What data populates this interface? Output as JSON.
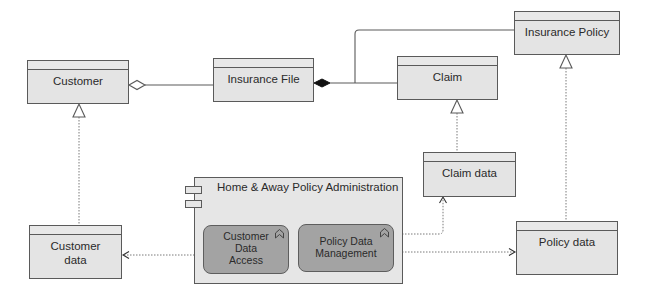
{
  "diagram": {
    "type": "ArchiMate / UML application-data diagram",
    "classes": {
      "customer": {
        "label": "Customer"
      },
      "insurance_file": {
        "label": "Insurance File"
      },
      "claim": {
        "label": "Claim"
      },
      "insurance_policy": {
        "label": "Insurance Policy"
      },
      "claim_data": {
        "label": "Claim data"
      },
      "customer_data": {
        "label": "Customer\ndata",
        "line1": "Customer",
        "line2": "data"
      },
      "policy_data": {
        "label": "Policy data"
      }
    },
    "component": {
      "label": "Home & Away Policy Administration",
      "icon": "component-icon",
      "functions": [
        {
          "label": "Customer Data Access",
          "line1": "Customer",
          "line2": "Data",
          "line3": "Access",
          "icon": "function-icon"
        },
        {
          "label": "Policy Data Management",
          "line1": "Policy Data",
          "line2": "Management",
          "icon": "function-icon"
        }
      ]
    },
    "relationships": [
      {
        "from": "Customer",
        "to": "Insurance File",
        "type": "aggregation"
      },
      {
        "from": "Insurance File",
        "to": "Claim",
        "type": "composition"
      },
      {
        "from": "Insurance File",
        "to": "Insurance Policy",
        "type": "composition"
      },
      {
        "from": "Customer data",
        "to": "Customer",
        "type": "realization"
      },
      {
        "from": "Claim data",
        "to": "Claim",
        "type": "realization"
      },
      {
        "from": "Policy data",
        "to": "Insurance Policy",
        "type": "realization"
      },
      {
        "from": "Customer Data Access",
        "to": "Customer data",
        "type": "access"
      },
      {
        "from": "Policy Data Management",
        "to": "Claim data",
        "type": "access"
      },
      {
        "from": "Policy Data Management",
        "to": "Policy data",
        "type": "access"
      }
    ],
    "colors": {
      "class_fill": "#e4e4e4",
      "function_fill": "#a3a3a3",
      "line": "#5a5a5a"
    }
  }
}
